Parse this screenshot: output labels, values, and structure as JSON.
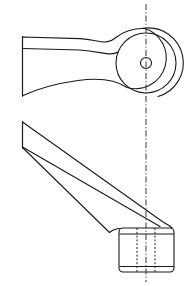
{
  "document": {
    "title": "Mechanical Part Orthographic Drawing",
    "kind": "engineering-line-drawing",
    "background_color": "#ffffff",
    "line_color": "#1a1a1a",
    "centerline_color": "#2a2a2a",
    "width_px": 188,
    "height_px": 286
  },
  "views": {
    "top": {
      "name": "top-view",
      "label": "",
      "description": "plan view of lever arm with circular boss",
      "boss": {
        "center_x": 146,
        "center_y": 63,
        "outer_radius": 35,
        "inner_radius": 30,
        "bore_radius": 5.5
      },
      "arm": {
        "left_edge_x": 22,
        "top_edge_y": 37,
        "bottom_edge_y": 49,
        "taper_bottom_y": 96
      }
    },
    "front": {
      "name": "front-view",
      "label": "",
      "description": "elevation of tapered arm with cylindrical boss and hidden bore",
      "boss": {
        "left_x": 119,
        "right_x": 174,
        "top_y": 228,
        "bottom_y": 272,
        "corner_radius": 4
      },
      "bore": {
        "left_x": 137,
        "right_x": 155,
        "top_y": 228,
        "bottom_y": 272
      },
      "arm": {
        "left_edge_x": 22,
        "top_left_y": 122,
        "top_right_y": 224,
        "bottom_left_y": 147,
        "bottom_right_y": 250
      }
    }
  },
  "annotations": {
    "centerline": {
      "name": "vertical-centerline",
      "x": 146,
      "top_y": 4,
      "bottom_y": 282
    }
  }
}
